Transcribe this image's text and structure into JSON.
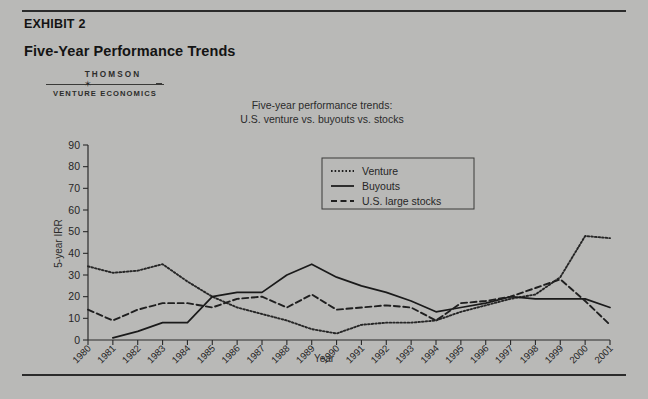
{
  "exhibit": {
    "label": "EXHIBIT 2",
    "title": "Five-Year Performance Trends"
  },
  "logo": {
    "top": "THOMSON",
    "bottom": "VENTURE ECONOMICS",
    "star": "✶"
  },
  "chart_data": {
    "type": "line",
    "title": "Five-year performance trends:\nU.S. venture vs. buyouts vs. stocks",
    "title_line1": "Five-year performance trends:",
    "title_line2": "U.S. venture vs. buyouts vs. stocks",
    "xlabel": "Year",
    "ylabel": "5-year IRR",
    "ylim": [
      0,
      90
    ],
    "yticks": [
      0,
      10,
      20,
      30,
      40,
      50,
      60,
      70,
      80,
      90
    ],
    "grid": false,
    "legend_position": "top-right",
    "categories": [
      "1980",
      "1981",
      "1982",
      "1983",
      "1984",
      "1985",
      "1986",
      "1987",
      "1988",
      "1989",
      "1990",
      "1991",
      "1992",
      "1993",
      "1994",
      "1995",
      "1996",
      "1997",
      "1998",
      "1999",
      "2000",
      "2001"
    ],
    "series": [
      {
        "name": "Venture",
        "style": "dotted",
        "color": "#262626",
        "values": [
          34,
          31,
          32,
          35,
          27,
          20,
          15,
          12,
          9,
          5,
          3,
          7,
          8,
          8,
          9,
          13,
          16,
          19,
          21,
          29,
          48,
          47
        ]
      },
      {
        "name": "Buyouts",
        "style": "solid",
        "color": "#1a1a1a",
        "values": [
          null,
          1,
          4,
          8,
          8,
          20,
          22,
          22,
          30,
          35,
          29,
          25,
          22,
          18,
          13,
          15,
          17,
          20,
          19,
          19,
          19,
          15
        ]
      },
      {
        "name": "U.S. large stocks",
        "style": "dashed",
        "color": "#1f1f1f",
        "values": [
          14,
          9,
          14,
          17,
          17,
          15,
          19,
          20,
          15,
          21,
          14,
          15,
          16,
          15,
          9,
          17,
          18,
          20,
          24,
          28,
          18,
          7
        ]
      }
    ]
  },
  "legend": {
    "items": [
      {
        "label": "Venture",
        "style": "dotted"
      },
      {
        "label": "Buyouts",
        "style": "solid"
      },
      {
        "label": "U.S. large stocks",
        "style": "dashed"
      }
    ]
  }
}
